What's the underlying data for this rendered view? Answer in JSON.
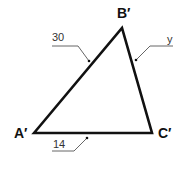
{
  "diagram": {
    "type": "triangle",
    "vertices": {
      "A": {
        "label": "A′"
      },
      "B": {
        "label": "B′"
      },
      "C": {
        "label": "C′"
      }
    },
    "sides": {
      "AB": {
        "label": "30"
      },
      "BC": {
        "label": "y"
      },
      "AC": {
        "label": "14"
      }
    },
    "colors": {
      "stroke": "#111111",
      "leader": "#555555"
    }
  }
}
